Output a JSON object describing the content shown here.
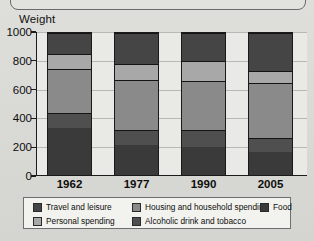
{
  "figure": {
    "axis_title": "Weight",
    "caption": ""
  },
  "chart_data": {
    "type": "bar",
    "stacked": true,
    "title": "Weight",
    "xlabel": "",
    "ylabel": "Weight",
    "ylim": [
      0,
      1000
    ],
    "yticks": [
      0,
      200,
      400,
      600,
      800,
      1000
    ],
    "ytick_labels": [
      "0",
      "200",
      "400",
      "600",
      "800",
      "1000"
    ],
    "grid": true,
    "legend_position": "bottom",
    "categories": [
      "1962",
      "1977",
      "1990",
      "2005"
    ],
    "series": [
      {
        "name": "Food",
        "color": "#3a3a3a",
        "values": [
          330,
          210,
          200,
          165
        ]
      },
      {
        "name": "Alcoholic drink and tobacco",
        "color": "#4f4f4f",
        "values": [
          110,
          110,
          115,
          95
        ]
      },
      {
        "name": "Housing and household spending",
        "color": "#8a8a8a",
        "values": [
          310,
          350,
          350,
          385
        ]
      },
      {
        "name": "Personal spending",
        "color": "#a8a8a8",
        "values": [
          100,
          110,
          135,
          90
        ]
      },
      {
        "name": "Travel and leisure",
        "color": "#454545",
        "values": [
          150,
          220,
          200,
          265
        ]
      }
    ],
    "totals": [
      1000,
      1000,
      1000,
      1000
    ]
  },
  "legend": {
    "items": [
      {
        "label": "Travel and leisure",
        "color": "#454545"
      },
      {
        "label": "Housing and household spending",
        "color": "#8a8a8a"
      },
      {
        "label": "Food",
        "color": "#3a3a3a"
      },
      {
        "label": "Personal spending",
        "color": "#a8a8a8"
      },
      {
        "label": "Alcoholic drink and tobacco",
        "color": "#4f4f4f"
      }
    ]
  }
}
